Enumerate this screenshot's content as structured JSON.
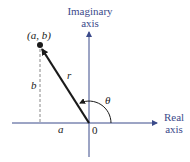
{
  "diagram": {
    "type": "complex-plane-polar-form",
    "labels": {
      "imaginary_axis_line1": "Imaginary",
      "imaginary_axis_line2": "axis",
      "real_axis_line1": "Real",
      "real_axis_line2": "axis",
      "point": "(a, b)",
      "radius": "r",
      "vertical_component": "b",
      "horizontal_component": "a",
      "origin": "0",
      "angle": "θ"
    },
    "colors": {
      "axis": "#3b4a8a",
      "vector": "#1a1a1a",
      "dashed": "#888888",
      "text": "#222222"
    }
  }
}
